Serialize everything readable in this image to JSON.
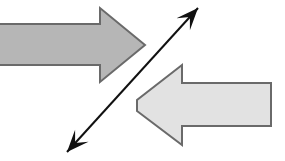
{
  "figure": {
    "title": "",
    "width": 285,
    "height": 161,
    "background_color": "#ffffff"
  },
  "shapes": [
    {
      "id": "block-arrow-right",
      "name": "right-pointing-block-arrow",
      "kind": "block-arrow",
      "direction": "right",
      "fill_color": "#b6b6b6",
      "stroke_color": "#6a6a6a",
      "stroke_width": 2,
      "points": "-6,24 100,24 100,8 145,45 100,82 100,65 -6,65",
      "tip_x": 145,
      "tip_y": 45,
      "shaft_top_y": 24,
      "shaft_bottom_y": 65,
      "head_top_y": 8,
      "head_bottom_y": 82,
      "clipped_at_left_edge": true
    },
    {
      "id": "block-arrow-left",
      "name": "left-pointing-block-arrow",
      "kind": "block-arrow",
      "direction": "left",
      "fill_color": "#e2e2e2",
      "stroke_color": "#6a6a6a",
      "stroke_width": 2,
      "points": "137,111 182,145 182,126 271,126 271,83 182,83 182,65 137,100 137,111",
      "tip_x": 137,
      "tip_y": 105,
      "shaft_top_y": 83,
      "shaft_bottom_y": 126,
      "head_top_y": 66,
      "head_bottom_y": 145,
      "tail_x": 271,
      "clipped_at_left_edge": false
    },
    {
      "id": "diagonal-double-arrow",
      "name": "diagonal-double-headed-arrow",
      "kind": "line-arrow",
      "direction": "bidirectional",
      "stroke_color": "#111111",
      "stroke_width": 2,
      "start_x": 67,
      "start_y": 152,
      "end_x": 198,
      "end_y": 8,
      "head_start": true,
      "head_end": true,
      "head_length": 22,
      "head_width": 9
    }
  ],
  "labels": []
}
